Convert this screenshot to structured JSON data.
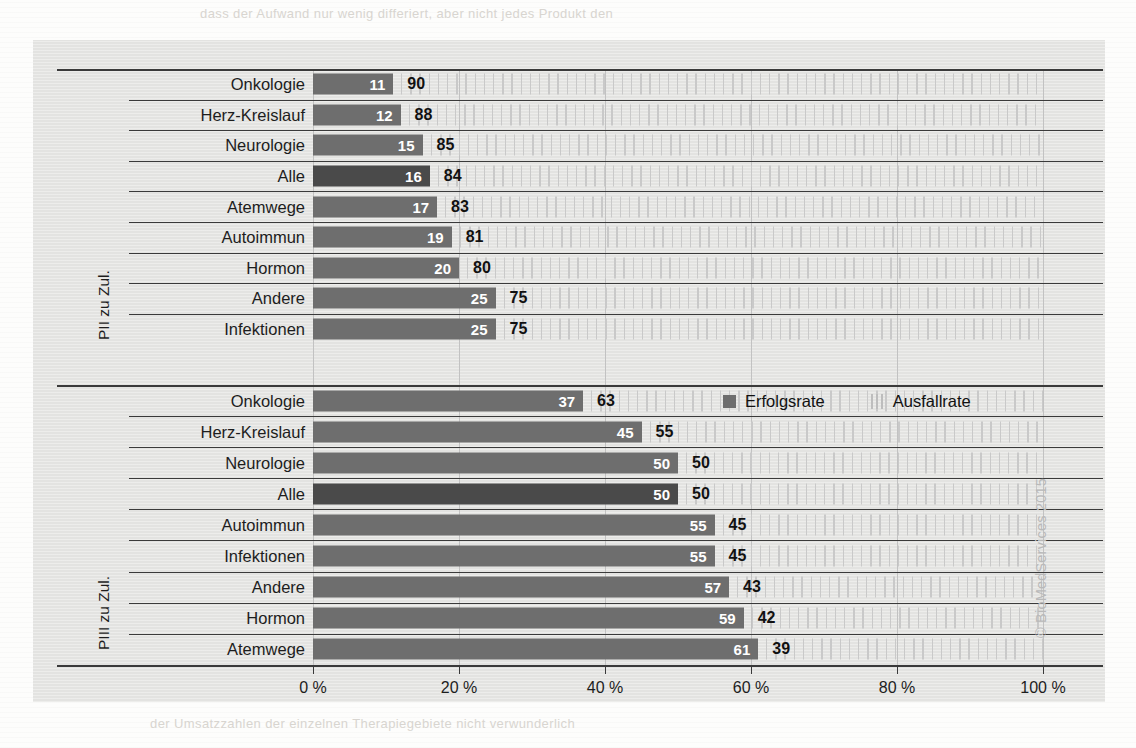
{
  "chart_data": {
    "type": "bar",
    "orientation": "horizontal",
    "stacked": true,
    "title": "",
    "xlabel": "",
    "xlim": [
      0,
      100
    ],
    "xticks": [
      "0 %",
      "20 %",
      "40 %",
      "60 %",
      "80 %",
      "100 %"
    ],
    "xtick_values": [
      0,
      20,
      40,
      60,
      80,
      100
    ],
    "grid": true,
    "legend_position": "middle-right",
    "legend": [
      "Erfolgsrate",
      "Ausfallrate"
    ],
    "series": [
      {
        "name": "Erfolgsrate",
        "color": "#6e6e6e"
      },
      {
        "name": "Ausfallrate",
        "color": "#c9c9c9"
      }
    ],
    "groups": [
      {
        "axis_label": "PII zu Zul.",
        "categories": [
          "Onkologie",
          "Herz-Kreislauf",
          "Neurologie",
          "Alle",
          "Atemwege",
          "Autoimmun",
          "Hormon",
          "Andere",
          "Infektionen"
        ],
        "erfolgsrate": [
          11,
          12,
          15,
          16,
          17,
          19,
          20,
          25,
          25
        ],
        "ausfallrate": [
          90,
          88,
          85,
          84,
          83,
          81,
          80,
          75,
          75
        ],
        "highlight": "Alle"
      },
      {
        "axis_label": "PIII zu Zul.",
        "categories": [
          "Onkologie",
          "Herz-Kreislauf",
          "Neurologie",
          "Alle",
          "Autoimmun",
          "Infektionen",
          "Andere",
          "Hormon",
          "Atemwege"
        ],
        "erfolgsrate": [
          37,
          45,
          50,
          50,
          55,
          55,
          57,
          59,
          61
        ],
        "ausfallrate": [
          63,
          55,
          50,
          50,
          45,
          45,
          43,
          42,
          39
        ],
        "highlight": "Alle"
      }
    ]
  },
  "credit": "© BioMedServices 2015",
  "ghost": {
    "line1": "dass der Aufwand nur wenig differiert, aber nicht jedes Produkt den",
    "line2": "der Umsatzzahlen der einzelnen Therapiegebiete nicht verwunderlich"
  }
}
